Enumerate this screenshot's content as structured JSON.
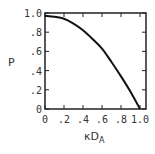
{
  "chart_data": {
    "type": "line",
    "title": "",
    "xlabel": "κD",
    "xlabel_subscript": "A",
    "ylabel": "P",
    "xlim": [
      0,
      1.03
    ],
    "ylim": [
      0,
      1.0
    ],
    "grid": false,
    "legend": null,
    "x_ticks": [
      0,
      0.2,
      0.4,
      0.6,
      0.8,
      1.0
    ],
    "x_tick_labels": [
      "0",
      ".2",
      ".4",
      ".6",
      ".8",
      "1.0"
    ],
    "y_ticks": [
      0,
      0.2,
      0.4,
      0.6,
      0.8,
      1.0
    ],
    "y_tick_labels": [
      "0",
      ".2",
      ".4",
      ".6",
      ".8",
      "1.0"
    ],
    "series": [
      {
        "name": "P",
        "x": [
          0,
          0.1,
          0.2,
          0.3,
          0.4,
          0.5,
          0.6,
          0.7,
          0.8,
          0.9,
          1.0
        ],
        "values": [
          0.97,
          0.96,
          0.94,
          0.89,
          0.82,
          0.73,
          0.63,
          0.49,
          0.34,
          0.18,
          0.0
        ]
      }
    ],
    "line_color": "#111111"
  }
}
